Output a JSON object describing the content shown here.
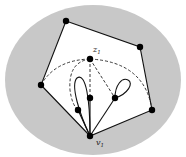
{
  "diagram": {
    "type": "graph-drawing",
    "background_region": {
      "shape": "ellipse",
      "cx": 93,
      "cy": 80,
      "rx": 88,
      "ry": 75,
      "fill": "#c8c8c8"
    },
    "face_fill": "#ffffff",
    "outer_polygon": [
      [
        66,
        21
      ],
      [
        140,
        47
      ],
      [
        152,
        110
      ],
      [
        90,
        136
      ],
      [
        41,
        85
      ]
    ],
    "vertices": [
      {
        "id": "p1",
        "x": 66,
        "y": 21
      },
      {
        "id": "p2",
        "x": 140,
        "y": 47
      },
      {
        "id": "p3",
        "x": 152,
        "y": 110
      },
      {
        "id": "v1",
        "x": 90,
        "y": 136,
        "label": "v1"
      },
      {
        "id": "p5",
        "x": 41,
        "y": 85
      },
      {
        "id": "z1",
        "x": 90,
        "y": 59,
        "label": "z1"
      },
      {
        "id": "m1",
        "x": 90,
        "y": 98
      },
      {
        "id": "m2",
        "x": 78,
        "y": 110
      },
      {
        "id": "m3",
        "x": 115,
        "y": 98
      }
    ],
    "labels": {
      "z1": {
        "base": "z",
        "sub": "1"
      },
      "v1": {
        "base": "v",
        "sub": "1"
      }
    },
    "solid_edges": [
      "v1-m1",
      "v1-m2",
      "v1-m3",
      "loop-left",
      "loop-right"
    ],
    "dashed_edges": [
      "z1-p5 arc",
      "z1-p3 arc",
      "z1-m1",
      "z1-m3",
      "z1 inner arc"
    ],
    "colors": {
      "stroke": "#111111",
      "vertex": "#000000",
      "region": "#c8c8c8"
    }
  }
}
